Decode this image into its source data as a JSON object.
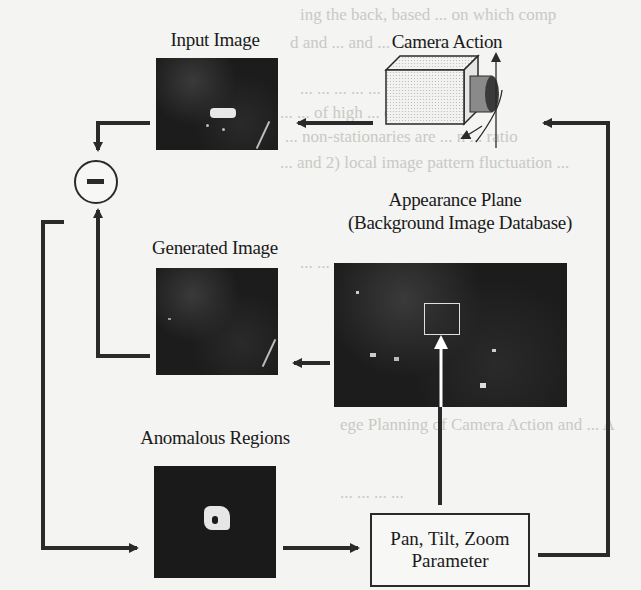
{
  "diagram": {
    "nodes": {
      "input_image": {
        "label": "Input Image"
      },
      "camera": {
        "label": "Camera Action"
      },
      "subtract": {
        "symbol": "−"
      },
      "appearance_plane": {
        "label_line1": "Appearance Plane",
        "label_line2": "(Background Image Database)"
      },
      "generated_image": {
        "label": "Generated Image"
      },
      "anomalous_regions": {
        "label": "Anomalous Regions"
      },
      "ptz_parameter": {
        "label_line1": "Pan, Tilt, Zoom",
        "label_line2": "Parameter"
      }
    },
    "edges": [
      {
        "from": "camera",
        "to": "input_image"
      },
      {
        "from": "input_image",
        "to": "subtract"
      },
      {
        "from": "generated_image",
        "to": "subtract"
      },
      {
        "from": "appearance_plane",
        "to": "generated_image"
      },
      {
        "from": "subtract",
        "to": "anomalous_regions"
      },
      {
        "from": "anomalous_regions",
        "to": "ptz_parameter"
      },
      {
        "from": "ptz_parameter",
        "to": "appearance_plane"
      },
      {
        "from": "ptz_parameter",
        "to": "camera"
      }
    ],
    "colors": {
      "line": "#2a2a2a",
      "photo_bg": "#1c1c1c",
      "page_bg": "#f4f4f2"
    }
  }
}
